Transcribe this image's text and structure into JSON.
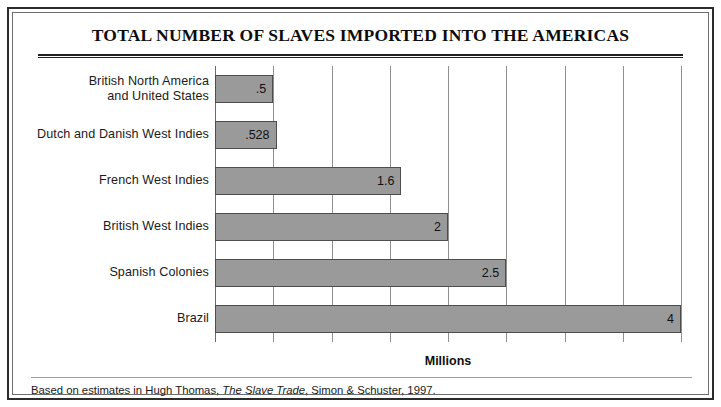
{
  "chart_data": {
    "type": "bar",
    "orientation": "horizontal",
    "title": "TOTAL NUMBER OF SLAVES IMPORTED INTO THE AMERICAS",
    "xlabel": "Millions",
    "ylabel": "",
    "xlim": [
      0,
      4
    ],
    "xticks": [
      0,
      0.5,
      1,
      1.5,
      2,
      2.5,
      3,
      3.5,
      4
    ],
    "grid": "vertical",
    "legend": "none",
    "categories": [
      "British North America and United States",
      "Dutch and Danish West Indies",
      "French West Indies",
      "British West Indies",
      "Spanish Colonies",
      "Brazil"
    ],
    "values": [
      0.5,
      0.528,
      1.6,
      2,
      2.5,
      4
    ],
    "value_labels": [
      ".5",
      ".528",
      "1.6",
      "2",
      "2.5",
      "4"
    ],
    "bars": [
      {
        "category_lines": [
          "British North America",
          "and United States"
        ],
        "value": 0.5,
        "label": ".5"
      },
      {
        "category_lines": [
          "Dutch and Danish West Indies"
        ],
        "value": 0.528,
        "label": ".528"
      },
      {
        "category_lines": [
          "French West Indies"
        ],
        "value": 1.6,
        "label": "1.6"
      },
      {
        "category_lines": [
          "British West Indies"
        ],
        "value": 2,
        "label": "2"
      },
      {
        "category_lines": [
          "Spanish Colonies"
        ],
        "value": 2.5,
        "label": "2.5"
      },
      {
        "category_lines": [
          "Brazil"
        ],
        "value": 4,
        "label": "4"
      }
    ],
    "colors": {
      "bar_fill": "#9a9a9a",
      "bar_border": "#4d4d4d",
      "gridline": "#8f8f8f",
      "text": "#111111",
      "frame": "#2b2b2b"
    }
  },
  "footnote": {
    "lead": "Based on estimates in Hugh Thomas, ",
    "source_title": "The Slave Trade",
    "trail": ", Simon & Schuster, 1997."
  }
}
